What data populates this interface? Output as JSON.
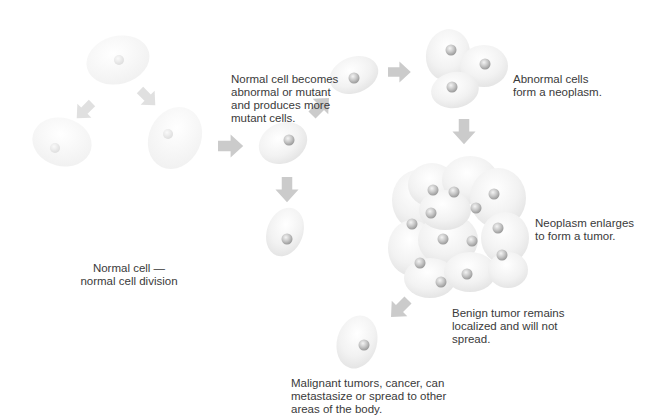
{
  "diagram": {
    "colors": {
      "cell_fill": "#f1f1f1",
      "cell_edge": "#e0e0e0",
      "nucleus": "#c8c8c8",
      "arrow": "#c9c9c9",
      "text": "#3a3a3a",
      "background": "#ffffff"
    },
    "labels": {
      "normal_division": "Normal cell —\nnormal cell division",
      "mutation": "Normal cell becomes\nabnormal or mutant\nand produces more\nmutant cells.",
      "neoplasm": "Abnormal cells\nform a neoplasm.",
      "tumor": "Neoplasm enlarges\nto form a tumor.",
      "benign": "Benign tumor remains\nlocalized and will not\nspread.",
      "malignant": "Malignant tumors, cancer, can\nmetastasize or spread to other\nareas of the body."
    },
    "stages": [
      {
        "id": "normal-cell",
        "label_ref": "normal_division"
      },
      {
        "id": "mutant-cell",
        "label_ref": "mutation"
      },
      {
        "id": "neoplasm",
        "label_ref": "neoplasm"
      },
      {
        "id": "tumor",
        "label_ref": "tumor"
      },
      {
        "id": "benign-tumor",
        "label_ref": "benign"
      },
      {
        "id": "metastasis",
        "label_ref": "malignant"
      }
    ]
  }
}
